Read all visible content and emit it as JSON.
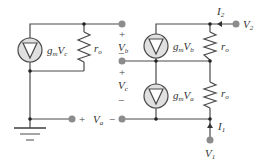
{
  "diagram": {
    "type": "small-signal equivalent circuit",
    "left_circuit": {
      "current_source": {
        "label": "g",
        "label_sub": "m",
        "label_var": "V",
        "label_var_sub": "c"
      },
      "resistor": {
        "label": "r",
        "label_sub": "o"
      },
      "ground": true
    },
    "right_circuit": {
      "upper_current_source": {
        "label": "g",
        "label_sub": "m",
        "label_var": "V",
        "label_var_sub": "b"
      },
      "upper_resistor": {
        "label": "r",
        "label_sub": "o"
      },
      "lower_current_source": {
        "label": "g",
        "label_sub": "m",
        "label_var": "V",
        "label_var_sub": "a"
      },
      "lower_resistor": {
        "label": "r",
        "label_sub": "o"
      }
    },
    "port_voltages": {
      "vb": {
        "plus": "+",
        "label": "V",
        "sub": "b",
        "minus": "−"
      },
      "vc": {
        "plus": "+",
        "label": "V",
        "sub": "c",
        "minus": "−"
      },
      "va": {
        "plus": "+",
        "label": "V",
        "sub": "a",
        "minus": "−"
      }
    },
    "terminals": {
      "v2": {
        "label": "V",
        "sub": "2"
      },
      "v1": {
        "label": "V",
        "sub": "1"
      }
    },
    "currents": {
      "i2": {
        "label": "I",
        "sub": "2"
      },
      "i1": {
        "label": "I",
        "sub": "1"
      }
    },
    "colors": {
      "wire": "#4a4a4a",
      "source_fill": "#e0e0e0",
      "terminal": "#8c8c8c"
    }
  }
}
